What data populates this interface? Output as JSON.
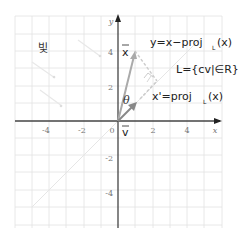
{
  "diagram": {
    "note_label": "빛",
    "axes": {
      "x_label": "x",
      "y_label": "y",
      "x_ticks": [
        "-4",
        "-2",
        "0",
        "2",
        "4"
      ],
      "y_ticks": [
        "4",
        "2",
        "-2",
        "-4"
      ]
    },
    "vectors": {
      "x_label": "x",
      "v_label": "v",
      "theta_label": "θ"
    },
    "equations": {
      "y_eq": "y=x−proj",
      "y_eq_sub": "L",
      "y_eq_tail": "(x)",
      "L_eq": "L={cv|∈R}",
      "xp_eq": "x'=proj",
      "xp_eq_sub": "L",
      "xp_eq_tail": "(x)"
    },
    "colors": {
      "grid": "#e2e2e2",
      "axis": "#444444",
      "vector_x": "#aaaaaa",
      "vector_v": "#888888",
      "line_L": "#e6e6e6",
      "dashed": "#cccccc"
    }
  }
}
